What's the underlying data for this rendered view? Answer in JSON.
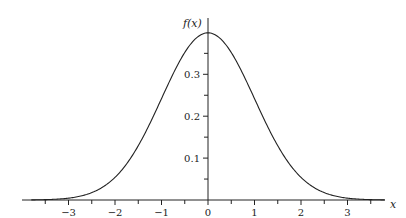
{
  "chart_data": {
    "type": "line",
    "title": "",
    "xlabel": "x",
    "ylabel": "f(x)",
    "function": "standard normal probability density function",
    "xlim": [
      -4.0,
      3.8
    ],
    "ylim": [
      0,
      0.42
    ],
    "grid": false,
    "legend": null,
    "x_ticks_labeled": [
      "−3",
      "−2",
      "−1",
      "0",
      "1",
      "2",
      "3"
    ],
    "x_tick_values": [
      -3,
      -2,
      -1,
      0,
      1,
      2,
      3
    ],
    "x_minor_ticks": [
      -3.5,
      -2.5,
      -1.5,
      -0.5,
      0.5,
      1.5,
      2.5,
      3.5
    ],
    "y_ticks_labeled": [
      "0.1",
      "0.2",
      "0.3"
    ],
    "y_tick_values": [
      0.1,
      0.2,
      0.3
    ],
    "y_minor_ticks": [
      0.05,
      0.15,
      0.25,
      0.35
    ],
    "series": [
      {
        "name": "f(x)",
        "x": [
          -3.5,
          -3,
          -2.5,
          -2,
          -1.5,
          -1,
          -0.5,
          0,
          0.5,
          1,
          1.5,
          2,
          2.5,
          3,
          3.5
        ],
        "values": [
          0.0009,
          0.0044,
          0.0175,
          0.054,
          0.1295,
          0.242,
          0.3521,
          0.3989,
          0.3521,
          0.242,
          0.1295,
          0.054,
          0.0175,
          0.0044,
          0.0009
        ]
      }
    ],
    "peak": {
      "x": 0,
      "y": 0.3989
    }
  },
  "axes": {
    "x_label": "x",
    "y_label": "f(x)"
  }
}
